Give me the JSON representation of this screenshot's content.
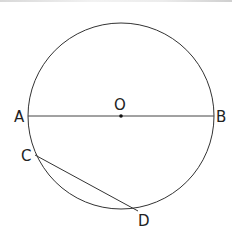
{
  "diagram": {
    "type": "circle-geometry",
    "circle": {
      "center_label": "O",
      "cx": 121,
      "cy": 116,
      "r": 93
    },
    "points": {
      "A": {
        "label": "A",
        "x": 28,
        "y": 116
      },
      "B": {
        "label": "B",
        "x": 214,
        "y": 116
      },
      "O": {
        "label": "O",
        "x": 121,
        "y": 116
      },
      "C": {
        "label": "C",
        "x": 35,
        "y": 155
      },
      "D": {
        "label": "D",
        "x": 138,
        "y": 211
      }
    },
    "segments": [
      {
        "from": "A",
        "to": "B",
        "name": "diameter-AB"
      },
      {
        "from": "C",
        "to": "D",
        "name": "chord-CD"
      }
    ],
    "colors": {
      "stroke": "#333333",
      "text": "#222222"
    }
  }
}
